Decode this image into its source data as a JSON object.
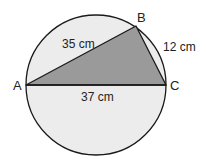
{
  "diagram": {
    "type": "geometry",
    "points": {
      "A": {
        "label": "A",
        "x": 26,
        "y": 85
      },
      "B": {
        "label": "B",
        "x": 136,
        "y": 26
      },
      "C": {
        "label": "C",
        "x": 166,
        "y": 85
      }
    },
    "circle": {
      "cx": 96,
      "cy": 85,
      "r": 70
    },
    "sides": {
      "AB": "35 cm",
      "BC": "12 cm",
      "AC": "37 cm"
    },
    "colors": {
      "circle_fill": "#ececec",
      "triangle_fill": "#9a9a9a",
      "stroke": "#1a1a1a"
    }
  }
}
